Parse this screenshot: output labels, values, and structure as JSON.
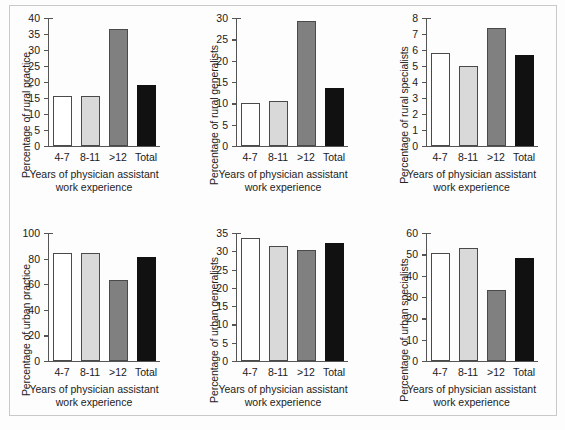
{
  "figure": {
    "shared_xlabel_line1": "Years of physician assistant",
    "shared_xlabel_line2": "work experience",
    "categories": [
      "4-7",
      "8-11",
      ">12",
      "Total"
    ],
    "bar_colors": [
      "#ffffff",
      "#d9d9d9",
      "#808080",
      "#111111"
    ],
    "axis_color": "#555555",
    "frame_color": "#c9c9c9"
  },
  "chart_data": [
    {
      "type": "bar",
      "title": "",
      "panel": "top-left",
      "categories": [
        "4-7",
        "8-11",
        ">12",
        "Total"
      ],
      "values": [
        15.5,
        15.5,
        36.7,
        19.2
      ],
      "xlabel": "Years of physician assistant work experience",
      "ylabel": "Percentage of rural practice",
      "ylim": [
        0,
        40
      ],
      "yticks": [
        0,
        5,
        10,
        15,
        20,
        25,
        30,
        35,
        40
      ],
      "grid": false,
      "legend": "none"
    },
    {
      "type": "bar",
      "title": "",
      "panel": "top-center",
      "categories": [
        "4-7",
        "8-11",
        ">12",
        "Total"
      ],
      "values": [
        10.0,
        10.6,
        29.3,
        13.6
      ],
      "xlabel": "Years of physician assistant work experience",
      "ylabel": "Percentage of rural generalists",
      "ylim": [
        0,
        30
      ],
      "yticks": [
        0,
        5,
        10,
        15,
        20,
        25,
        30
      ],
      "grid": false,
      "legend": "none"
    },
    {
      "type": "bar",
      "title": "",
      "panel": "top-right",
      "categories": [
        "4-7",
        "8-11",
        ">12",
        "Total"
      ],
      "values": [
        5.8,
        5.0,
        7.4,
        5.7
      ],
      "xlabel": "Years of physician assistant work experience",
      "ylabel": "Percentage of rural specialists",
      "ylim": [
        0,
        8
      ],
      "yticks": [
        0,
        1,
        2,
        3,
        4,
        5,
        6,
        7,
        8
      ],
      "grid": false,
      "legend": "none"
    },
    {
      "type": "bar",
      "title": "",
      "panel": "bottom-left",
      "categories": [
        "4-7",
        "8-11",
        ">12",
        "Total"
      ],
      "values": [
        84.4,
        84.4,
        63.4,
        80.9
      ],
      "xlabel": "Years of physician assistant work experience",
      "ylabel": "Percentage of urban practice",
      "ylim": [
        0,
        100
      ],
      "yticks": [
        0,
        20,
        40,
        60,
        80,
        100
      ],
      "grid": false,
      "legend": "none"
    },
    {
      "type": "bar",
      "title": "",
      "panel": "bottom-center",
      "categories": [
        "4-7",
        "8-11",
        ">12",
        "Total"
      ],
      "values": [
        33.7,
        31.4,
        30.3,
        32.2
      ],
      "xlabel": "Years of physician assistant work experience",
      "ylabel": "Percentage of urban generalists",
      "ylim": [
        0,
        35
      ],
      "yticks": [
        0,
        5,
        10,
        15,
        20,
        25,
        30,
        35
      ],
      "grid": false,
      "legend": "none"
    },
    {
      "type": "bar",
      "title": "",
      "panel": "bottom-right",
      "categories": [
        "4-7",
        "8-11",
        ">12",
        "Total"
      ],
      "values": [
        50.5,
        53.1,
        33.3,
        48.5
      ],
      "xlabel": "Years of physician assistant work experience",
      "ylabel": "Percentage of urban specialists",
      "ylim": [
        0,
        60
      ],
      "yticks": [
        0,
        10,
        20,
        30,
        40,
        50,
        60
      ],
      "grid": false,
      "legend": "none"
    }
  ]
}
